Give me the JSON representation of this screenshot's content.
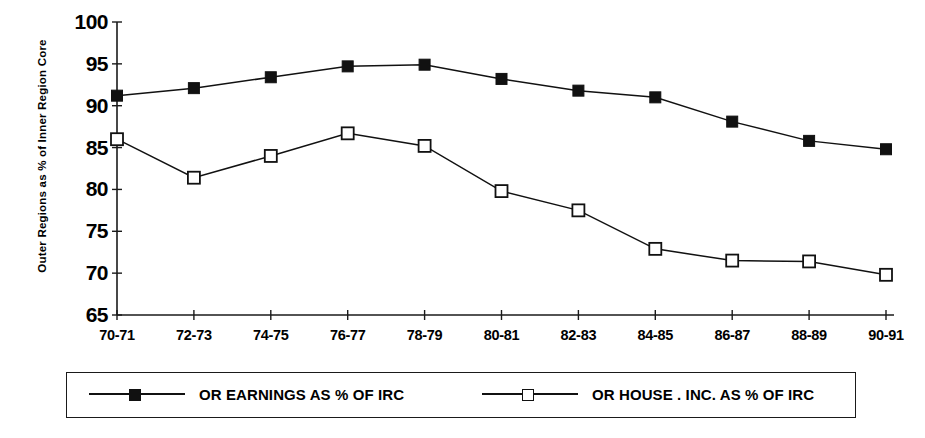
{
  "chart_data": {
    "type": "line",
    "title": "",
    "subtitle": "",
    "xlabel": "",
    "ylabel": "Outer Regions as % of Inner Region Core",
    "categories": [
      "70-71",
      "72-73",
      "74-75",
      "76-77",
      "78-79",
      "80-81",
      "82-83",
      "84-85",
      "86-87",
      "88-89",
      "90-91"
    ],
    "ylim": [
      65,
      100
    ],
    "yticks": [
      65,
      70,
      75,
      80,
      85,
      90,
      95,
      100
    ],
    "ytick_labels": [
      "65",
      "70",
      "75",
      "80",
      "85",
      "90",
      "95",
      "100"
    ],
    "grid": false,
    "legend_position": "bottom",
    "series": [
      {
        "name": "OR EARNINGS AS % OF IRC",
        "marker": "filled-square",
        "color": "#111111",
        "values": [
          91.2,
          92.1,
          93.4,
          94.7,
          94.9,
          93.2,
          91.8,
          91.0,
          88.1,
          85.8,
          84.8
        ]
      },
      {
        "name": "OR HOUSE . INC. AS % OF IRC",
        "marker": "open-square",
        "color": "#111111",
        "values": [
          86.0,
          81.4,
          84.0,
          86.7,
          85.2,
          79.8,
          77.5,
          72.9,
          71.5,
          71.4,
          69.8
        ]
      }
    ]
  },
  "legend": {
    "items": [
      {
        "label": "OR EARNINGS AS % OF IRC"
      },
      {
        "label": "OR HOUSE . INC. AS % OF IRC"
      }
    ]
  }
}
